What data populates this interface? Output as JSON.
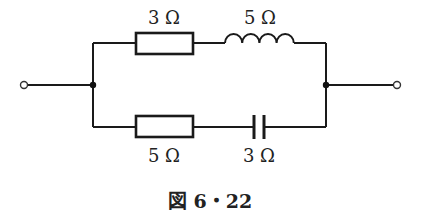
{
  "diagram": {
    "type": "circuit",
    "branches": [
      {
        "position": "top",
        "components": [
          {
            "type": "resistor",
            "label": "3 Ω"
          },
          {
            "type": "inductor",
            "label": "5 Ω"
          }
        ]
      },
      {
        "position": "bottom",
        "components": [
          {
            "type": "resistor",
            "label": "5 Ω"
          },
          {
            "type": "capacitor",
            "label": "3 Ω"
          }
        ]
      }
    ],
    "labels": {
      "top_resistor": "3 Ω",
      "inductor": "5 Ω",
      "bottom_resistor": "5 Ω",
      "capacitor": "3 Ω"
    },
    "caption": "図 6・22"
  }
}
